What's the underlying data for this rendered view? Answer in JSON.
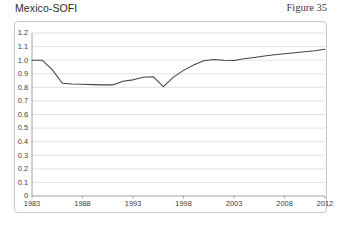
{
  "header": {
    "title": "Mexico-SOFI",
    "figure_label": "Figure 35"
  },
  "chart_data": {
    "type": "line",
    "title": "Mexico-SOFI",
    "xlabel": "",
    "ylabel": "",
    "xlim": [
      1983,
      2012
    ],
    "ylim": [
      0,
      1.2
    ],
    "grid": true,
    "legend": false,
    "line_color": "#444444",
    "ytick_labels": [
      "1.2",
      "1.1",
      "1.0",
      "0.9",
      "0.8",
      "0.7",
      "0.6",
      "0.5",
      "0.4",
      "0.3",
      "0.2",
      "0.1",
      "0"
    ],
    "ytick_values": [
      1.2,
      1.1,
      1.0,
      0.9,
      0.8,
      0.7,
      0.6,
      0.5,
      0.4,
      0.3,
      0.2,
      0.1,
      0
    ],
    "xtick_labels": [
      "1983",
      "1988",
      "1993",
      "1998",
      "2003",
      "2008",
      "2012"
    ],
    "xtick_values": [
      1983,
      1988,
      1993,
      1998,
      2003,
      2008,
      2012
    ],
    "x": [
      1983,
      1984,
      1985,
      1986,
      1987,
      1988,
      1989,
      1990,
      1991,
      1992,
      1993,
      1994,
      1995,
      1996,
      1997,
      1998,
      1999,
      2000,
      2001,
      2002,
      2003,
      2004,
      2005,
      2006,
      2007,
      2008,
      2009,
      2010,
      2011,
      2012
    ],
    "values": [
      1.0,
      1.0,
      0.93,
      0.83,
      0.825,
      0.822,
      0.82,
      0.818,
      0.818,
      0.845,
      0.855,
      0.875,
      0.878,
      0.805,
      0.875,
      0.925,
      0.965,
      0.995,
      1.005,
      1.0,
      0.998,
      1.01,
      1.02,
      1.03,
      1.04,
      1.048,
      1.055,
      1.062,
      1.07,
      1.08
    ]
  }
}
